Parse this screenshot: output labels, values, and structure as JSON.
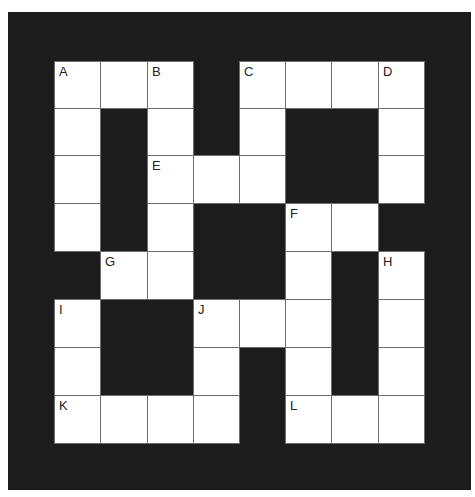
{
  "puzzle": {
    "type": "crossword",
    "rows": 8,
    "cols": 8,
    "cells": [
      {
        "r": 0,
        "c": 0,
        "label": "A"
      },
      {
        "r": 0,
        "c": 1,
        "label": ""
      },
      {
        "r": 0,
        "c": 2,
        "label": "B"
      },
      {
        "r": 0,
        "c": 4,
        "label": "C"
      },
      {
        "r": 0,
        "c": 5,
        "label": ""
      },
      {
        "r": 0,
        "c": 6,
        "label": ""
      },
      {
        "r": 0,
        "c": 7,
        "label": "D"
      },
      {
        "r": 1,
        "c": 0,
        "label": ""
      },
      {
        "r": 1,
        "c": 2,
        "label": ""
      },
      {
        "r": 1,
        "c": 4,
        "label": ""
      },
      {
        "r": 1,
        "c": 7,
        "label": ""
      },
      {
        "r": 2,
        "c": 0,
        "label": ""
      },
      {
        "r": 2,
        "c": 2,
        "label": "E"
      },
      {
        "r": 2,
        "c": 3,
        "label": ""
      },
      {
        "r": 2,
        "c": 4,
        "label": ""
      },
      {
        "r": 2,
        "c": 7,
        "label": ""
      },
      {
        "r": 3,
        "c": 0,
        "label": ""
      },
      {
        "r": 3,
        "c": 2,
        "label": ""
      },
      {
        "r": 3,
        "c": 5,
        "label": "F"
      },
      {
        "r": 3,
        "c": 6,
        "label": ""
      },
      {
        "r": 4,
        "c": 1,
        "label": "G"
      },
      {
        "r": 4,
        "c": 2,
        "label": ""
      },
      {
        "r": 4,
        "c": 5,
        "label": ""
      },
      {
        "r": 4,
        "c": 7,
        "label": "H"
      },
      {
        "r": 5,
        "c": 0,
        "label": "I"
      },
      {
        "r": 5,
        "c": 3,
        "label": "J"
      },
      {
        "r": 5,
        "c": 4,
        "label": ""
      },
      {
        "r": 5,
        "c": 5,
        "label": ""
      },
      {
        "r": 5,
        "c": 7,
        "label": ""
      },
      {
        "r": 6,
        "c": 0,
        "label": ""
      },
      {
        "r": 6,
        "c": 3,
        "label": ""
      },
      {
        "r": 6,
        "c": 5,
        "label": ""
      },
      {
        "r": 6,
        "c": 7,
        "label": ""
      },
      {
        "r": 7,
        "c": 0,
        "label": "K"
      },
      {
        "r": 7,
        "c": 1,
        "label": ""
      },
      {
        "r": 7,
        "c": 2,
        "label": ""
      },
      {
        "r": 7,
        "c": 3,
        "label": ""
      },
      {
        "r": 7,
        "c": 5,
        "label": "L"
      },
      {
        "r": 7,
        "c": 6,
        "label": ""
      },
      {
        "r": 7,
        "c": 7,
        "label": ""
      }
    ]
  },
  "colors": {
    "block": "#1c1c1c",
    "cell": "#ffffff",
    "gridline": "#6e6e6e"
  }
}
